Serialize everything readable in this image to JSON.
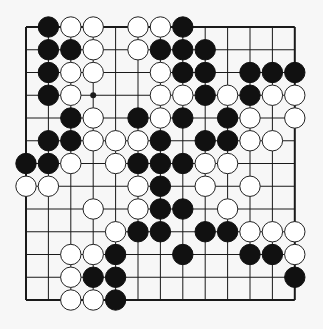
{
  "board": {
    "size": 13,
    "origin": {
      "x": 26,
      "y": 27
    },
    "spacing": {
      "x": 22.4,
      "y": 22.75
    },
    "stone_radius": 10.2,
    "colors": {
      "background": "#f7f7f7",
      "line": "#1a1a1a",
      "black_stone": "#111111",
      "white_stone": "#ffffff",
      "white_stroke": "#222222"
    },
    "star_points": [
      [
        3,
        3
      ],
      [
        3,
        9
      ]
    ],
    "stones": [
      {
        "row": 0,
        "col": 1,
        "color": "black"
      },
      {
        "row": 0,
        "col": 2,
        "color": "white"
      },
      {
        "row": 0,
        "col": 3,
        "color": "white"
      },
      {
        "row": 0,
        "col": 5,
        "color": "white"
      },
      {
        "row": 0,
        "col": 6,
        "color": "white"
      },
      {
        "row": 0,
        "col": 7,
        "color": "black"
      },
      {
        "row": 1,
        "col": 1,
        "color": "black"
      },
      {
        "row": 1,
        "col": 2,
        "color": "black"
      },
      {
        "row": 1,
        "col": 3,
        "color": "white"
      },
      {
        "row": 1,
        "col": 5,
        "color": "white"
      },
      {
        "row": 1,
        "col": 6,
        "color": "black"
      },
      {
        "row": 1,
        "col": 7,
        "color": "black"
      },
      {
        "row": 1,
        "col": 8,
        "color": "black"
      },
      {
        "row": 2,
        "col": 1,
        "color": "black"
      },
      {
        "row": 2,
        "col": 2,
        "color": "white"
      },
      {
        "row": 2,
        "col": 3,
        "color": "white"
      },
      {
        "row": 2,
        "col": 6,
        "color": "white"
      },
      {
        "row": 2,
        "col": 7,
        "color": "black"
      },
      {
        "row": 2,
        "col": 8,
        "color": "black"
      },
      {
        "row": 2,
        "col": 10,
        "color": "black"
      },
      {
        "row": 2,
        "col": 11,
        "color": "black"
      },
      {
        "row": 2,
        "col": 12,
        "color": "black"
      },
      {
        "row": 3,
        "col": 1,
        "color": "black"
      },
      {
        "row": 3,
        "col": 2,
        "color": "white"
      },
      {
        "row": 3,
        "col": 6,
        "color": "white"
      },
      {
        "row": 3,
        "col": 7,
        "color": "white"
      },
      {
        "row": 3,
        "col": 8,
        "color": "black"
      },
      {
        "row": 3,
        "col": 9,
        "color": "white"
      },
      {
        "row": 3,
        "col": 10,
        "color": "black"
      },
      {
        "row": 3,
        "col": 11,
        "color": "white"
      },
      {
        "row": 3,
        "col": 12,
        "color": "white"
      },
      {
        "row": 4,
        "col": 2,
        "color": "black"
      },
      {
        "row": 4,
        "col": 3,
        "color": "white"
      },
      {
        "row": 4,
        "col": 5,
        "color": "black"
      },
      {
        "row": 4,
        "col": 6,
        "color": "white"
      },
      {
        "row": 4,
        "col": 7,
        "color": "black"
      },
      {
        "row": 4,
        "col": 9,
        "color": "black"
      },
      {
        "row": 4,
        "col": 10,
        "color": "white"
      },
      {
        "row": 4,
        "col": 12,
        "color": "white"
      },
      {
        "row": 5,
        "col": 1,
        "color": "black"
      },
      {
        "row": 5,
        "col": 2,
        "color": "black"
      },
      {
        "row": 5,
        "col": 3,
        "color": "white"
      },
      {
        "row": 5,
        "col": 4,
        "color": "white"
      },
      {
        "row": 5,
        "col": 5,
        "color": "white"
      },
      {
        "row": 5,
        "col": 6,
        "color": "black"
      },
      {
        "row": 5,
        "col": 8,
        "color": "black"
      },
      {
        "row": 5,
        "col": 9,
        "color": "black"
      },
      {
        "row": 5,
        "col": 10,
        "color": "white"
      },
      {
        "row": 5,
        "col": 11,
        "color": "white"
      },
      {
        "row": 6,
        "col": 0,
        "color": "black"
      },
      {
        "row": 6,
        "col": 1,
        "color": "black"
      },
      {
        "row": 6,
        "col": 2,
        "color": "white"
      },
      {
        "row": 6,
        "col": 4,
        "color": "white"
      },
      {
        "row": 6,
        "col": 5,
        "color": "black"
      },
      {
        "row": 6,
        "col": 6,
        "color": "black"
      },
      {
        "row": 6,
        "col": 7,
        "color": "black"
      },
      {
        "row": 6,
        "col": 8,
        "color": "white"
      },
      {
        "row": 6,
        "col": 9,
        "color": "white"
      },
      {
        "row": 7,
        "col": 0,
        "color": "white"
      },
      {
        "row": 7,
        "col": 1,
        "color": "white"
      },
      {
        "row": 7,
        "col": 5,
        "color": "white"
      },
      {
        "row": 7,
        "col": 6,
        "color": "black"
      },
      {
        "row": 7,
        "col": 8,
        "color": "white"
      },
      {
        "row": 7,
        "col": 10,
        "color": "white"
      },
      {
        "row": 8,
        "col": 3,
        "color": "white"
      },
      {
        "row": 8,
        "col": 5,
        "color": "white"
      },
      {
        "row": 8,
        "col": 6,
        "color": "black"
      },
      {
        "row": 8,
        "col": 7,
        "color": "black"
      },
      {
        "row": 8,
        "col": 9,
        "color": "white"
      },
      {
        "row": 9,
        "col": 4,
        "color": "white"
      },
      {
        "row": 9,
        "col": 5,
        "color": "black"
      },
      {
        "row": 9,
        "col": 6,
        "color": "black"
      },
      {
        "row": 9,
        "col": 8,
        "color": "black"
      },
      {
        "row": 9,
        "col": 9,
        "color": "black"
      },
      {
        "row": 9,
        "col": 10,
        "color": "white"
      },
      {
        "row": 9,
        "col": 11,
        "color": "white"
      },
      {
        "row": 9,
        "col": 12,
        "color": "white"
      },
      {
        "row": 10,
        "col": 2,
        "color": "white"
      },
      {
        "row": 10,
        "col": 3,
        "color": "white"
      },
      {
        "row": 10,
        "col": 4,
        "color": "black"
      },
      {
        "row": 10,
        "col": 7,
        "color": "black"
      },
      {
        "row": 10,
        "col": 10,
        "color": "black"
      },
      {
        "row": 10,
        "col": 11,
        "color": "black"
      },
      {
        "row": 10,
        "col": 12,
        "color": "white"
      },
      {
        "row": 11,
        "col": 2,
        "color": "white"
      },
      {
        "row": 11,
        "col": 3,
        "color": "black"
      },
      {
        "row": 11,
        "col": 4,
        "color": "black"
      },
      {
        "row": 11,
        "col": 12,
        "color": "black"
      },
      {
        "row": 12,
        "col": 2,
        "color": "white"
      },
      {
        "row": 12,
        "col": 3,
        "color": "white"
      },
      {
        "row": 12,
        "col": 4,
        "color": "black"
      }
    ]
  }
}
